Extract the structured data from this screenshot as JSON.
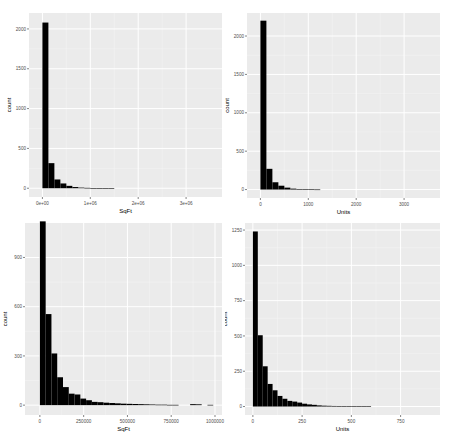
{
  "colors": {
    "panel_bg": "#ebebeb",
    "grid_major": "#ffffff",
    "grid_minor": "#f4f4f4",
    "bar_fill": "#000000",
    "axis_text": "#4d4d4d",
    "title_text": "#000000"
  },
  "chart_data": [
    {
      "id": "top_left",
      "type": "bar",
      "title": "",
      "xlabel": "SqFt",
      "ylabel": "count",
      "grid": true,
      "xlim": [
        -280000,
        3750000
      ],
      "ylim": [
        -110,
        2200
      ],
      "xticks": [
        0,
        1000000,
        2000000,
        3000000
      ],
      "xtick_labels": [
        "0e+00",
        "1e+06",
        "2e+06",
        "3e+06"
      ],
      "yticks": [
        0,
        500,
        1000,
        1500,
        2000
      ],
      "ytick_labels": [
        "0",
        "500",
        "1000",
        "1500",
        "2000"
      ],
      "bin_width": 125000,
      "bins_start": 0,
      "values": [
        2080,
        315,
        110,
        60,
        30,
        15,
        8,
        5,
        3,
        2,
        2,
        1
      ]
    },
    {
      "id": "top_right",
      "type": "bar",
      "title": "",
      "xlabel": "Units",
      "ylabel": "count",
      "grid": true,
      "xlim": [
        -280,
        3750
      ],
      "ylim": [
        -110,
        2300
      ],
      "xticks": [
        0,
        1000,
        2000,
        3000
      ],
      "xtick_labels": [
        "0",
        "1000",
        "2000",
        "3000"
      ],
      "yticks": [
        0,
        500,
        1000,
        1500,
        2000
      ],
      "ytick_labels": [
        "0",
        "500",
        "1000",
        "1500",
        "2000"
      ],
      "bin_width": 125,
      "bins_start": 0,
      "values": [
        2200,
        270,
        95,
        50,
        25,
        12,
        7,
        3,
        2,
        1
      ]
    },
    {
      "id": "bottom_left",
      "type": "bar",
      "title": "",
      "xlabel": "SqFt",
      "ylabel": "count",
      "grid": true,
      "xlim": [
        -85000,
        1040000
      ],
      "ylim": [
        -60,
        1110
      ],
      "xticks": [
        0,
        250000,
        500000,
        750000,
        1000000
      ],
      "xtick_labels": [
        "0",
        "250000",
        "500000",
        "750000",
        "1000000"
      ],
      "yticks": [
        0,
        300,
        600,
        900
      ],
      "ytick_labels": [
        "0",
        "300",
        "600",
        "900"
      ],
      "bin_width": 33000,
      "bins_start": 0,
      "values": [
        1120,
        555,
        315,
        170,
        110,
        70,
        65,
        40,
        30,
        20,
        18,
        15,
        13,
        11,
        9,
        8,
        7,
        6,
        5,
        4,
        3,
        3,
        2,
        2,
        0,
        0,
        6,
        5,
        0,
        2
      ]
    },
    {
      "id": "bottom_right",
      "type": "bar",
      "title": "",
      "xlabel": "Units",
      "ylabel": "count",
      "grid": true,
      "xlim": [
        -40,
        950
      ],
      "ylim": [
        -60,
        1300
      ],
      "xticks": [
        0,
        250,
        500,
        750
      ],
      "xtick_labels": [
        "0",
        "250",
        "500",
        "750"
      ],
      "yticks": [
        0,
        250,
        500,
        750,
        1000,
        1250
      ],
      "ytick_labels": [
        "0",
        "250",
        "500",
        "750",
        "1000",
        "1250"
      ],
      "bin_width": 25,
      "bins_start": 0,
      "values": [
        1240,
        505,
        285,
        160,
        115,
        75,
        55,
        40,
        35,
        28,
        20,
        15,
        12,
        8,
        6,
        5,
        4,
        3,
        3,
        2,
        2,
        1,
        1,
        1
      ]
    }
  ]
}
